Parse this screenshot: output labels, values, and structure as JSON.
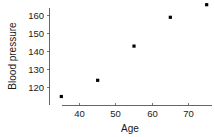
{
  "chart_data": {
    "type": "scatter",
    "title": "",
    "xlabel": "Age",
    "ylabel": "Blood pressure",
    "x": [
      35,
      45,
      55,
      65,
      75
    ],
    "values": [
      115,
      124,
      143,
      159,
      166
    ],
    "series": [
      {
        "name": "Blood pressure vs Age",
        "points": [
          {
            "x": 35,
            "y": 115
          },
          {
            "x": 45,
            "y": 124
          },
          {
            "x": 55,
            "y": 143
          },
          {
            "x": 65,
            "y": 159
          },
          {
            "x": 75,
            "y": 166
          }
        ]
      }
    ],
    "xticks": [
      40,
      50,
      60,
      70
    ],
    "yticks": [
      120,
      130,
      140,
      150,
      160
    ],
    "xlim": [
      32,
      78
    ],
    "ylim": [
      112,
      169
    ],
    "grid": false,
    "legend": false,
    "marker": "square",
    "marker_color": "#000000",
    "axis_color": "#555555",
    "background": "#ffffff"
  },
  "axes": {
    "x_title": "Age",
    "y_title": "Blood pressure",
    "x_tick_labels": [
      "40",
      "50",
      "60",
      "70"
    ],
    "y_tick_labels": [
      "120",
      "130",
      "140",
      "150",
      "160"
    ]
  }
}
